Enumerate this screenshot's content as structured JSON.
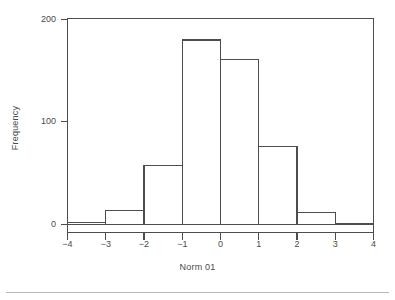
{
  "chart_data": {
    "type": "bar",
    "subtype": "histogram",
    "title": "",
    "xlabel": "Norm 01",
    "ylabel": "Frequency",
    "xlim": [
      -4,
      4
    ],
    "ylim": [
      0,
      200
    ],
    "grid": false,
    "legend": null,
    "bin_width": 1,
    "bin_edges": [
      -4,
      -3,
      -2,
      -1,
      0,
      1,
      2,
      3,
      4
    ],
    "categories": [
      "-4 to -3",
      "-3 to -2",
      "-2 to -1",
      "-1 to 0",
      "0 to 1",
      "1 to 2",
      "2 to 3",
      "3 to 4"
    ],
    "bin_centers": [
      -3.5,
      -2.5,
      -1.5,
      -0.5,
      0.5,
      1.5,
      2.5,
      3.5
    ],
    "values": [
      2,
      14,
      58,
      180,
      161,
      76,
      12,
      1
    ],
    "xticks": [
      -4,
      -3,
      -2,
      -1,
      0,
      1,
      2,
      3,
      4
    ],
    "xtick_labels": [
      "−4",
      "−3",
      "−2",
      "−1",
      "0",
      "1",
      "2",
      "3",
      "4"
    ],
    "yticks": [
      0,
      100,
      200
    ],
    "ytick_labels": [
      "0",
      "100",
      "200"
    ],
    "line_color": "#4d4d4d",
    "fill_color": "#ffffff",
    "axis_color": "#4d4d4d",
    "background_color": "#ffffff"
  }
}
